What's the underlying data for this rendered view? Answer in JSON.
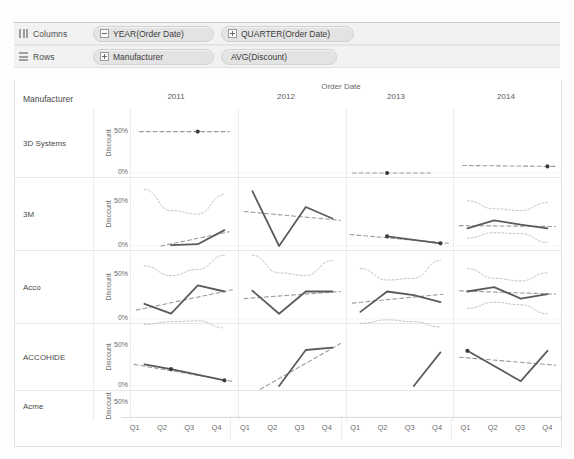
{
  "shelves": {
    "columns": {
      "label": "Columns",
      "icon": "columns-icon",
      "pills": [
        {
          "text": "YEAR(Order Date)",
          "toggle": "minus"
        },
        {
          "text": "QUARTER(Order Date)",
          "toggle": "plus"
        }
      ]
    },
    "rows": {
      "label": "Rows",
      "icon": "rows-icon",
      "pills": [
        {
          "text": "Manufacturer",
          "toggle": "plus"
        },
        {
          "text": "AVG(Discount)",
          "toggle": "none"
        }
      ]
    }
  },
  "viz": {
    "column_field_title": "Order Date",
    "row_header_title": "Manufacturer",
    "axis_title": "Discount",
    "axis_ticks": [
      "50%",
      "0%"
    ],
    "years": [
      "2011",
      "2012",
      "2013",
      "2014"
    ],
    "quarters": [
      "Q1",
      "Q2",
      "Q3",
      "Q4"
    ],
    "manufacturers": [
      "3D Systems",
      "3M",
      "Acco",
      "ACCOHIDE",
      "Acme"
    ],
    "colors": {
      "line": "#5a5a5a",
      "trend": "#9a9a9a",
      "confidence": "#b8b8c8",
      "marker": "#3c3c3c",
      "grid": "#ececec",
      "pill": "#e3e3e3",
      "shelf_bg": "#f2f2f2"
    }
  },
  "chart_data": {
    "type": "line",
    "xlabel": "Order Date",
    "ylabel": "Discount",
    "ylim": [
      0,
      70
    ],
    "ytick_values": [
      0,
      50
    ],
    "ytick_labels": [
      "0%",
      "50%"
    ],
    "grid": true,
    "legend": "none",
    "x": [
      "2011 Q1",
      "2011 Q2",
      "2011 Q3",
      "2011 Q4",
      "2012 Q1",
      "2012 Q2",
      "2012 Q3",
      "2012 Q4",
      "2013 Q1",
      "2013 Q2",
      "2013 Q3",
      "2013 Q4",
      "2014 Q1",
      "2014 Q2",
      "2014 Q3",
      "2014 Q4"
    ],
    "panel_rows": [
      "3D Systems",
      "3M",
      "Acco",
      "ACCOHIDE",
      "Acme"
    ],
    "panel_cols": [
      "2011",
      "2012",
      "2013",
      "2014"
    ],
    "series": [
      {
        "name": "3D Systems",
        "panels": [
          {
            "year": "2011",
            "values": [
              null,
              null,
              50,
              null
            ],
            "trend": [
              50,
              50
            ],
            "trend_span": [
              0.08,
              0.92
            ],
            "confidence": null,
            "markers": [
              {
                "q": "Q3",
                "v": 50
              }
            ]
          },
          {
            "year": "2012",
            "values": [
              null,
              null,
              null,
              null
            ],
            "trend": null,
            "confidence": null,
            "markers": []
          },
          {
            "year": "2013",
            "values": [
              null,
              0,
              null,
              null
            ],
            "trend": [
              0,
              0
            ],
            "trend_span": [
              0.05,
              0.78
            ],
            "confidence": null,
            "markers": [
              {
                "q": "Q2",
                "v": 0
              }
            ]
          },
          {
            "year": "2014",
            "values": [
              null,
              null,
              null,
              8
            ],
            "trend": [
              9,
              8
            ],
            "trend_span": [
              0.08,
              0.95
            ],
            "confidence": null,
            "markers": [
              {
                "q": "Q4",
                "v": 8
              }
            ]
          }
        ]
      },
      {
        "name": "3M",
        "panels": [
          {
            "year": "2011",
            "values": [
              null,
              1,
              2,
              18
            ],
            "trend": [
              0,
              16
            ],
            "trend_span": [
              0.28,
              0.92
            ],
            "confidence": {
              "upper": [
                64,
                40,
                36,
                58
              ],
              "lower": null
            },
            "markers": []
          },
          {
            "year": "2012",
            "values": [
              62,
              0,
              44,
              31
            ],
            "trend": [
              39,
              29
            ],
            "trend_span": [
              0.05,
              0.95
            ],
            "confidence": null,
            "markers": []
          },
          {
            "year": "2013",
            "values": [
              null,
              11,
              null,
              3
            ],
            "trend": [
              13,
              3
            ],
            "trend_span": [
              0.03,
              0.95
            ],
            "confidence": null,
            "markers": [
              {
                "q": "Q2",
                "v": 11
              },
              {
                "q": "Q4",
                "v": 3
              }
            ]
          },
          {
            "year": "2014",
            "values": [
              20,
              29,
              24,
              20
            ],
            "trend": [
              23,
              22
            ],
            "trend_span": [
              0.05,
              0.95
            ],
            "confidence": {
              "upper": [
                51,
                42,
                40,
                49
              ],
              "lower": [
                9,
                15,
                14,
                4
              ]
            },
            "markers": []
          }
        ]
      },
      {
        "name": "Acco",
        "panels": [
          {
            "year": "2011",
            "values": [
              17,
              6,
              38,
              31
            ],
            "trend": [
              10,
              33
            ],
            "trend_span": [
              0.05,
              0.95
            ],
            "confidence": {
              "upper": [
                60,
                49,
                56,
                72
              ],
              "lower": [
                -6,
                -3,
                -2,
                -10
              ]
            },
            "markers": []
          },
          {
            "year": "2012",
            "values": [
              32,
              6,
              31,
              31
            ],
            "trend": [
              23,
              31
            ],
            "trend_span": [
              0.05,
              0.95
            ],
            "confidence": {
              "upper": [
                72,
                52,
                49,
                66
              ],
              "lower": null
            },
            "markers": []
          },
          {
            "year": "2013",
            "values": [
              8,
              31,
              27,
              19
            ],
            "trend": [
              18,
              28
            ],
            "trend_span": [
              0.05,
              0.9
            ],
            "confidence": {
              "upper": [
                57,
                44,
                46,
                66
              ],
              "lower": [
                -5,
                -1,
                -3,
                -9
              ]
            },
            "markers": []
          },
          {
            "year": "2014",
            "values": [
              31,
              36,
              23,
              28
            ],
            "trend": [
              32,
              28
            ],
            "trend_span": [
              0.05,
              0.95
            ],
            "confidence": {
              "upper": [
                57,
                46,
                43,
                52
              ],
              "lower": [
                12,
                19,
                16,
                6
              ]
            },
            "markers": []
          }
        ]
      },
      {
        "name": "ACCOHIDE",
        "panels": [
          {
            "year": "2011",
            "values": [
              27,
              21,
              null,
              7
            ],
            "trend": [
              27,
              6
            ],
            "trend_span": [
              0.03,
              0.95
            ],
            "confidence": null,
            "markers": [
              {
                "q": "Q2",
                "v": 21
              },
              {
                "q": "Q4",
                "v": 7
              }
            ]
          },
          {
            "year": "2012",
            "values": [
              null,
              0,
              45,
              48
            ],
            "trend": [
              -4,
              53
            ],
            "trend_span": [
              0.2,
              0.95
            ],
            "confidence": null,
            "markers": []
          },
          {
            "year": "2013",
            "values": [
              null,
              null,
              0,
              42
            ],
            "trend": null,
            "trend_span": null,
            "confidence": null,
            "markers": []
          },
          {
            "year": "2014",
            "values": [
              44,
              null,
              6,
              44
            ],
            "trend": [
              36,
              26
            ],
            "trend_span": [
              0.05,
              0.95
            ],
            "confidence": null,
            "markers": [
              {
                "q": "Q1",
                "v": 44
              }
            ]
          }
        ]
      },
      {
        "name": "Acme",
        "panels": [
          {
            "year": "2011",
            "values": [
              null,
              null,
              null,
              null
            ],
            "trend": null,
            "confidence": null,
            "markers": []
          },
          {
            "year": "2012",
            "values": [
              null,
              null,
              null,
              null
            ],
            "trend": null,
            "confidence": null,
            "markers": []
          },
          {
            "year": "2013",
            "values": [
              null,
              null,
              null,
              null
            ],
            "trend": null,
            "confidence": null,
            "markers": []
          },
          {
            "year": "2014",
            "values": [
              null,
              null,
              null,
              null
            ],
            "trend": null,
            "confidence": null,
            "markers": []
          }
        ]
      }
    ]
  }
}
